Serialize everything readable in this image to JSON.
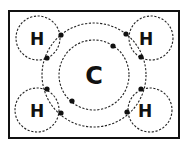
{
  "diagram": {
    "molecule": "methane",
    "central_atom": {
      "symbol": "C",
      "shells": 2
    },
    "outer_atoms": [
      {
        "symbol": "H",
        "position": "top-left"
      },
      {
        "symbol": "H",
        "position": "top-right"
      },
      {
        "symbol": "H",
        "position": "bottom-left"
      },
      {
        "symbol": "H",
        "position": "bottom-right"
      }
    ],
    "colors": {
      "line": "#111111",
      "background": "#ffffff"
    }
  }
}
